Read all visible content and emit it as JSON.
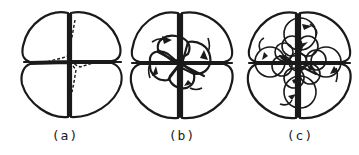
{
  "figure": {
    "panels": [
      {
        "id": "a",
        "label": "(a)",
        "description": "Four-cell stage, quadrant blastomeres with dashed interior boundaries"
      },
      {
        "id": "b",
        "label": "(b)",
        "description": "Four macromeres with first quartet of micromeres; arrows show spiral (dextral) rotation"
      },
      {
        "id": "c",
        "label": "(c)",
        "description": "Further spiral cleavage with multiple micromere tiers; arrows show alternating rotation"
      }
    ],
    "colors": {
      "ink": "#1a1a1a",
      "background": "#ffffff"
    }
  }
}
